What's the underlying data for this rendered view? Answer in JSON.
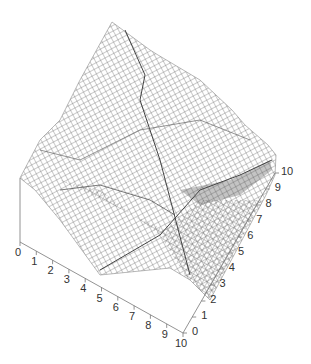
{
  "chart_data": {
    "type": "surface",
    "title": "",
    "xlabel": "",
    "ylabel": "",
    "zlabel": "",
    "x_axis": {
      "ticks": [
        "0",
        "1",
        "2",
        "3",
        "4",
        "5",
        "6",
        "7",
        "8",
        "9",
        "10"
      ],
      "range": [
        0,
        10
      ]
    },
    "y_axis": {
      "ticks": [
        "0",
        "1",
        "2",
        "3",
        "4",
        "5",
        "6",
        "7",
        "8",
        "9",
        "10"
      ],
      "range": [
        0,
        10
      ]
    },
    "grid": true,
    "style": "wireframe mesh, grayscale"
  },
  "colors": {
    "mesh": "#555555",
    "axis": "#777777",
    "text": "#333333",
    "background": "#ffffff"
  }
}
